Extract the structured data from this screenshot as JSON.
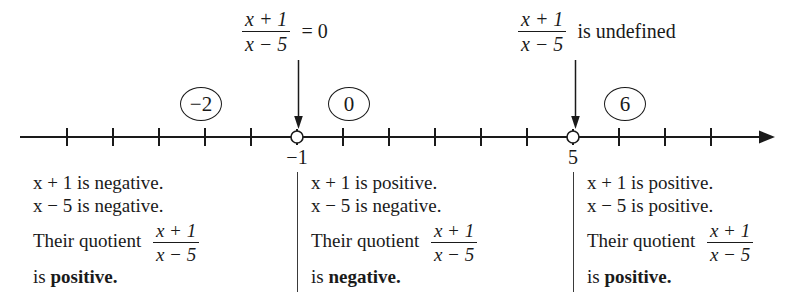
{
  "diagram": {
    "type": "sign-chart-number-line",
    "expression": {
      "numerator": "x + 1",
      "denominator": "x - 5"
    },
    "top_annotations": [
      {
        "id": "zero-annotation",
        "numerator": "x + 1",
        "denominator": "x - 5",
        "tail": "= 0",
        "arrow_to": "-1"
      },
      {
        "id": "undefined-annotation",
        "numerator": "x + 1",
        "denominator": "x - 5",
        "tail": "is undefined",
        "arrow_to": "5"
      }
    ],
    "number_line": {
      "tick_count": 15,
      "open_points": [
        {
          "label": "-1",
          "value": -1
        },
        {
          "label": "5",
          "value": 5
        }
      ],
      "arrow_right": true,
      "point_labels": [
        "-1",
        "5"
      ]
    },
    "test_values": [
      {
        "label": "-2",
        "region": "left"
      },
      {
        "label": "0",
        "region": "middle"
      },
      {
        "label": "6",
        "region": "right"
      }
    ],
    "regions": [
      {
        "id": "region-left",
        "line1": "x + 1 is negative.",
        "line2": "x - 5 is negative.",
        "quotient_lead": "Their quotient",
        "quotient_num": "x + 1",
        "quotient_den": "x - 5",
        "conclusion_lead": "is",
        "conclusion": "positive."
      },
      {
        "id": "region-middle",
        "line1": "x + 1 is positive.",
        "line2": "x - 5 is negative.",
        "quotient_lead": "Their quotient",
        "quotient_num": "x + 1",
        "quotient_den": "x - 5",
        "conclusion_lead": "is",
        "conclusion": "negative."
      },
      {
        "id": "region-right",
        "line1": "x + 1 is positive.",
        "line2": "x - 5 is positive.",
        "quotient_lead": "Their quotient",
        "quotient_num": "x + 1",
        "quotient_den": "x - 5",
        "conclusion_lead": "is",
        "conclusion": "positive."
      }
    ],
    "colors": {
      "ink": "#1a1a1a",
      "rule": "#3a3a3a",
      "background": "#ffffff"
    }
  }
}
